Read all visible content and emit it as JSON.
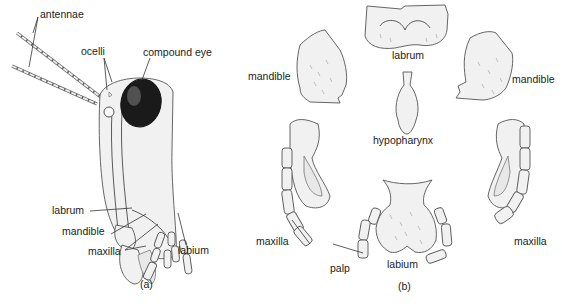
{
  "figure": {
    "panel_a": {
      "caption": "(a)",
      "labels": {
        "antennae": "antennae",
        "ocelli": "ocelli",
        "compound_eye": "compound eye",
        "labrum": "labrum",
        "mandible": "mandible",
        "maxilla": "maxilla",
        "labium": "labium"
      }
    },
    "panel_b": {
      "caption": "(b)",
      "labels": {
        "labrum": "labrum",
        "mandible_left": "mandible",
        "mandible_right": "mandible",
        "hypopharynx": "hypopharynx",
        "maxilla_left": "maxilla",
        "maxilla_right": "maxilla",
        "palp": "palp",
        "labium": "labium"
      }
    }
  }
}
